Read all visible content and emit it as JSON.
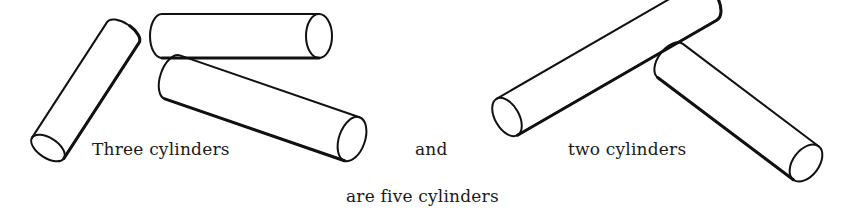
{
  "captions": {
    "three": "Three cylinders",
    "and": "and",
    "two": "two cylinders",
    "result": "are five cylinders"
  },
  "figure": {
    "group_left_count": 3,
    "group_right_count": 2,
    "total_count": 5,
    "shape": "cylinder"
  }
}
